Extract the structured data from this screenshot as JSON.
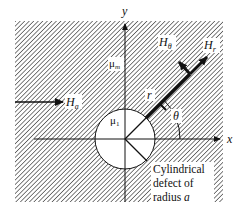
{
  "figure": {
    "axes": {
      "x_label": "x",
      "y_label": "y"
    },
    "labels": {
      "applied_field": {
        "symbol": "H",
        "subscript": "a"
      },
      "radial_field": {
        "symbol": "H",
        "subscript": "r"
      },
      "tangential_field": {
        "symbol": "H",
        "subscript": "θ"
      },
      "matrix_permeability": {
        "symbol": "μ",
        "subscript": "m"
      },
      "defect_permeability": {
        "symbol": "μ",
        "subscript": "1"
      },
      "radius": "r",
      "angle": "θ"
    },
    "annotation": {
      "line1": "Cylindrical",
      "line2": "defect of",
      "line3_prefix": "radius ",
      "line3_var": "a"
    },
    "colors": {
      "hatch": "#3a3a3a",
      "background": "#ffffff",
      "ink": "#111111"
    }
  }
}
